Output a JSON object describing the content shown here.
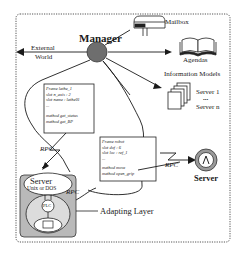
{
  "diagram": {
    "manager_label": "Manager",
    "external_world_label": "External World",
    "external_world_line1": "External",
    "external_world_line2": "World",
    "mailbox_label": "Mailbox",
    "agendas_label": "Agendas",
    "information_models_label": "Information Models",
    "server_list": {
      "first": "Server 1",
      "ellipsis": "•••",
      "last": "Server n"
    },
    "frame_lathe": {
      "title": "Frame  lathe_1",
      "lines": [
        "slot n_axis : 2",
        "slot name : lathe01",
        "...",
        "",
        "method get_status",
        "method get_BP"
      ]
    },
    "frame_robot": {
      "title": "Frame  robot",
      "lines": [
        "slot dof : 6",
        "slot loc : ref_1",
        "...",
        "",
        "method move",
        "method open_grip"
      ]
    },
    "rpc_labels": [
      "RPC",
      "RPC",
      "RPC"
    ],
    "server_right_label": "Server",
    "adapting_server": {
      "title": "Server",
      "subtitle": "Unix or DOS",
      "plc_label": "PLC"
    },
    "adapting_layer_label": "Adapting Layer",
    "colors": {
      "line": "#1a1a1a",
      "manager_fill": "#6e6e6e",
      "adapting_box_fill": "#b9b9b9",
      "dotted_border": "#555555"
    }
  }
}
